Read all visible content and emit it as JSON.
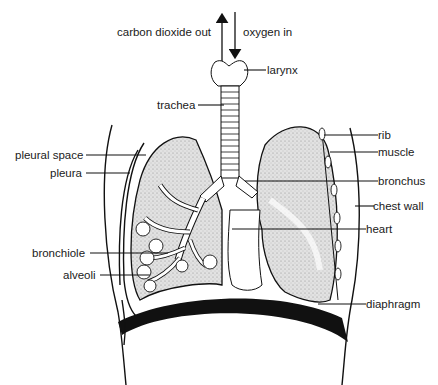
{
  "diagram": {
    "labels": {
      "co2_out": "carbon dioxide out",
      "oxygen_in": "oxygen in",
      "larynx": "larynx",
      "trachea": "trachea",
      "pleural_space": "pleural space",
      "pleura": "pleura",
      "bronchiole": "bronchiole",
      "alveoli": "alveoli",
      "rib": "rib",
      "muscle": "muscle",
      "bronchus": "bronchus",
      "chest_wall": "chest wall",
      "heart": "heart",
      "diaphragm": "diaphragm"
    },
    "colors": {
      "ink": "#111111",
      "lung_fill": "#d9d9d9",
      "background": "#ffffff"
    }
  }
}
